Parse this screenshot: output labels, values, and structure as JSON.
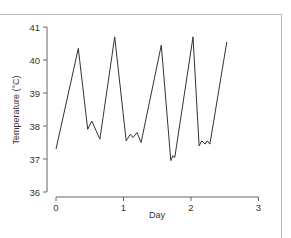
{
  "chart_data": {
    "type": "line",
    "title": "",
    "xlabel": "Day",
    "ylabel": "Temperature (°C)",
    "xlim": [
      0,
      3
    ],
    "ylim": [
      36,
      41
    ],
    "x_ticks": [
      0,
      1,
      2,
      3
    ],
    "y_ticks": [
      36,
      37,
      38,
      39,
      40,
      41
    ],
    "grid": false,
    "legend": null,
    "series": [
      {
        "name": "Temperature",
        "color": "#333333",
        "x": [
          0.0,
          0.33,
          0.47,
          0.53,
          0.65,
          0.87,
          1.04,
          1.1,
          1.14,
          1.2,
          1.26,
          1.56,
          1.7,
          1.73,
          1.76,
          2.03,
          2.12,
          2.16,
          2.21,
          2.24,
          2.28,
          2.53
        ],
        "y": [
          37.3,
          40.35,
          37.9,
          38.15,
          37.6,
          40.7,
          37.55,
          37.75,
          37.65,
          37.8,
          37.5,
          40.45,
          36.95,
          37.1,
          37.05,
          40.7,
          37.4,
          37.55,
          37.45,
          37.55,
          37.45,
          40.55
        ]
      }
    ]
  }
}
